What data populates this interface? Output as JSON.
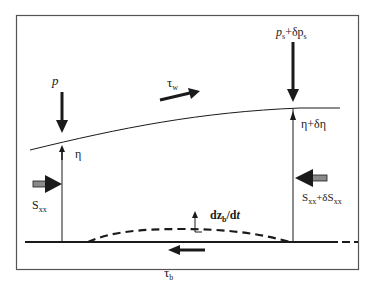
{
  "diagram": {
    "type": "free-body force diagram (nearshore control volume)",
    "labels": {
      "p": "p",
      "ps_main": "p",
      "ps_sub": "s",
      "ps_plus": "+δp",
      "ps_sub2": "s",
      "tau_w_main": "τ",
      "tau_w_sub": "w",
      "eta": "η",
      "eta_delta": "η+δη",
      "sxx_main": "S",
      "sxx_sub": "xx",
      "sxx_delta_main": "S",
      "sxx_delta_sub": "xx",
      "sxx_delta_plus": "+δS",
      "sxx_delta_sub2": "xx",
      "dzb_d": "dz",
      "dzb_sub": "b",
      "dzb_rest": "/d",
      "dzb_t": "t",
      "tau_b_main": "τ",
      "tau_b_sub": "b"
    },
    "colors": {
      "line": "#1a1a1a",
      "frame": "#555555",
      "double_arrow_fill": "#8a8a8a"
    }
  }
}
